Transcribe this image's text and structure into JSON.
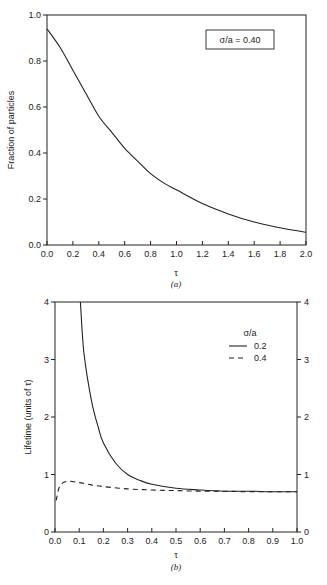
{
  "chart_data": [
    {
      "type": "line",
      "panel": "(a)",
      "title": "",
      "xlabel": "τ",
      "ylabel": "Fraction of particles",
      "xlim": [
        0.0,
        2.0
      ],
      "ylim": [
        0.0,
        1.0
      ],
      "xticks": [
        "0.0",
        "0.2",
        "0.4",
        "0.6",
        "0.8",
        "1.0",
        "1.2",
        "1.4",
        "1.6",
        "1.8",
        "2.0"
      ],
      "yticks": [
        "0.0",
        "0.2",
        "0.4",
        "0.6",
        "0.8",
        "1.0"
      ],
      "grid": false,
      "annotation": "σ/a = 0.40",
      "series": [
        {
          "name": "σ/a = 0.40",
          "style": "solid",
          "x": [
            0.0,
            0.1,
            0.2,
            0.3,
            0.4,
            0.5,
            0.6,
            0.7,
            0.8,
            0.9,
            1.0,
            1.2,
            1.4,
            1.6,
            1.8,
            2.0
          ],
          "y": [
            0.94,
            0.86,
            0.76,
            0.66,
            0.56,
            0.49,
            0.42,
            0.365,
            0.31,
            0.27,
            0.24,
            0.18,
            0.135,
            0.1,
            0.075,
            0.055
          ]
        }
      ]
    },
    {
      "type": "line",
      "panel": "(b)",
      "title": "",
      "xlabel": "τ",
      "ylabel": "Lifetime (units of τ)",
      "xlim": [
        0.0,
        1.0
      ],
      "ylim": [
        0,
        4
      ],
      "xticks": [
        "0.0",
        "0.1",
        "0.2",
        "0.3",
        "0.4",
        "0.5",
        "0.6",
        "0.7",
        "0.8",
        "0.9",
        "1.0"
      ],
      "yticks": [
        "0",
        "1",
        "2",
        "3",
        "4"
      ],
      "right_yticks": [
        "0",
        "1",
        "2",
        "3",
        "4"
      ],
      "grid": false,
      "legend_title": "σ/a",
      "legend_position": "upper right",
      "series": [
        {
          "name": "0.2",
          "style": "solid",
          "x": [
            0.105,
            0.12,
            0.15,
            0.18,
            0.2,
            0.25,
            0.3,
            0.35,
            0.4,
            0.5,
            0.6,
            0.7,
            0.8,
            0.9,
            1.0
          ],
          "y": [
            4.0,
            3.1,
            2.3,
            1.8,
            1.55,
            1.2,
            1.0,
            0.9,
            0.83,
            0.76,
            0.73,
            0.71,
            0.71,
            0.7,
            0.7
          ]
        },
        {
          "name": "0.4",
          "style": "dashed",
          "x": [
            0.005,
            0.02,
            0.05,
            0.1,
            0.15,
            0.2,
            0.3,
            0.4,
            0.5,
            0.6,
            0.7,
            0.8,
            1.0
          ],
          "y": [
            0.55,
            0.8,
            0.88,
            0.86,
            0.82,
            0.79,
            0.75,
            0.73,
            0.72,
            0.71,
            0.71,
            0.7,
            0.7
          ]
        }
      ]
    }
  ],
  "panels": {
    "a": {
      "ylabel": "Fraction of particles",
      "xlabel": "τ",
      "caption": "(a)",
      "annotation": "σ/a = 0.40"
    },
    "b": {
      "ylabel": "Lifetime (units of τ)",
      "xlabel": "τ",
      "caption": "(b)",
      "legend_title": "σ/a",
      "legend_items": [
        "0.2",
        "0.4"
      ]
    }
  }
}
